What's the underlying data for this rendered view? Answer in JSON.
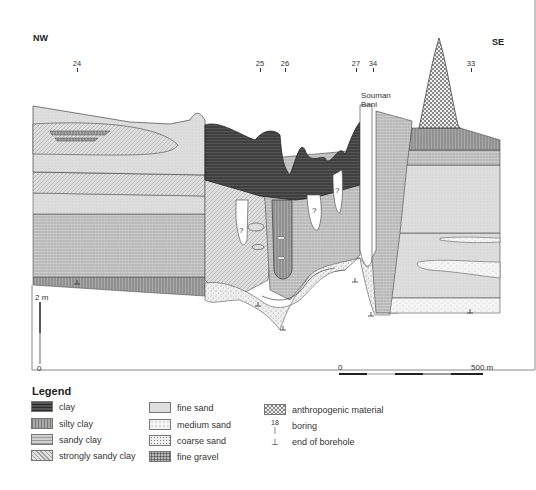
{
  "orientation": {
    "left": "NW",
    "right": "SE"
  },
  "borings": [
    {
      "id": "24",
      "x": 77
    },
    {
      "id": "25",
      "x": 260
    },
    {
      "id": "26",
      "x": 285
    },
    {
      "id": "27",
      "x": 356
    },
    {
      "id": "34",
      "x": 373
    },
    {
      "id": "33",
      "x": 471
    }
  ],
  "river_label": {
    "line1": "Souman",
    "line2": "Bani"
  },
  "unknown_marker": "?",
  "vertical_scale": {
    "top": "2 m",
    "bottom": "0"
  },
  "horizontal_scale": {
    "start": "0",
    "end": "500 m"
  },
  "legend": {
    "title": "Legend",
    "col1": [
      {
        "label": "clay",
        "pattern": "clay"
      },
      {
        "label": "silty clay",
        "pattern": "silty"
      },
      {
        "label": "sandy clay",
        "pattern": "sandyclay"
      },
      {
        "label": "strongly sandy clay",
        "pattern": "strongsandy"
      }
    ],
    "col2": [
      {
        "label": "fine sand",
        "pattern": "finesand"
      },
      {
        "label": "medium sand",
        "pattern": "medsand"
      },
      {
        "label": "coarse sand",
        "pattern": "coarsesand"
      },
      {
        "label": "fine gravel",
        "pattern": "gravel"
      }
    ],
    "col3": [
      {
        "label": "anthropogenic material",
        "pattern": "anthro"
      },
      {
        "label": "boring",
        "symbol_number": "18"
      },
      {
        "label": "end of borehole",
        "symbol": "⊥"
      }
    ]
  },
  "colors": {
    "clay": "#4a4a4a",
    "silty_clay": "#9a9a9a",
    "sandy_clay": "#bdbdbd",
    "fine_sand": "#dcdcdc",
    "frame": "#888888"
  }
}
